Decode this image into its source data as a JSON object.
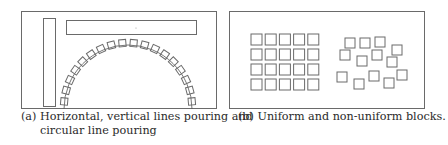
{
  "figure": {
    "stroke_color": "#6a6a6a",
    "subfigures": [
      {
        "id": "a",
        "caption_label": "(a)",
        "caption_line1": "(a) Horizontal, vertical lines pouring and",
        "caption_line2": "circular line pouring",
        "elements": {
          "vertical_bar": "vertical-line-pouring",
          "horizontal_bar": "horizontal-line-pouring",
          "arc": "circular-line-pouring",
          "arc_block_count": 18
        }
      },
      {
        "id": "b",
        "caption_label": "(b)",
        "caption_line1": "(b) Uniform and non-uniform blocks.",
        "elements": {
          "uniform_grid": {
            "columns": 5,
            "rows": 4
          },
          "non_uniform_block_count": 13
        }
      }
    ]
  }
}
